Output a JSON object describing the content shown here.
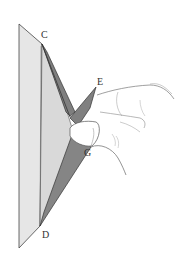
{
  "figure": {
    "labels": [
      {
        "id": "C",
        "text": "C",
        "x": 41,
        "y": 30
      },
      {
        "id": "E",
        "text": "E",
        "x": 97,
        "y": 77
      },
      {
        "id": "G",
        "text": "G",
        "x": 84,
        "y": 148
      },
      {
        "id": "D",
        "text": "D",
        "x": 42,
        "y": 230
      }
    ],
    "colors": {
      "paper_light": "#e2e2e2",
      "paper_mid": "#cfcfcf",
      "paper_dark": "#7a7a7a",
      "outline": "#444444",
      "hand_line": "#8a8a8a"
    }
  }
}
